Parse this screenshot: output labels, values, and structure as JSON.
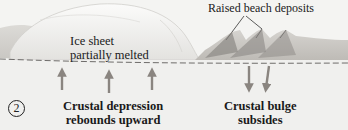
{
  "diagram": {
    "step_number": "2",
    "labels": {
      "ice_sheet_line1": "Ice sheet",
      "ice_sheet_line2": "partially melted",
      "raised_beach": "Raised beach deposits",
      "depression_line1": "Crustal depression",
      "depression_line2": "rebounds upward",
      "bulge_line1": "Crustal bulge",
      "bulge_line2": "subsides"
    },
    "arrows": {
      "up_count": 3,
      "down_count": 2,
      "color": "#8a8580"
    },
    "colors": {
      "background": "#f4f4f2",
      "ice": "#ececea",
      "land": "#c8c6c2",
      "beach_ridges": "#8f8c88",
      "dashed_line": "#6e6c6a",
      "text": "#1a1a1a"
    }
  }
}
